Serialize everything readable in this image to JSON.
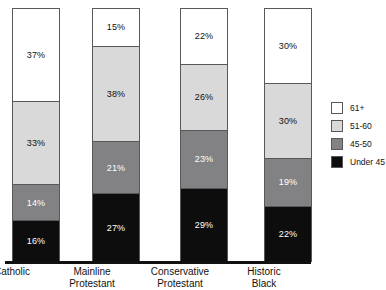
{
  "chart_data": {
    "type": "bar",
    "subtype": "stacked-100-percent",
    "title": "",
    "subtitle": "",
    "xlabel": "",
    "ylabel": "",
    "ylim": [
      0,
      100
    ],
    "grid": false,
    "legend_position": "right",
    "categories": [
      "Catholic",
      "Mainline Protestant",
      "Conservative Protestant",
      "Historic Black"
    ],
    "category_lines": [
      [
        "Catholic"
      ],
      [
        "Mainline",
        "Protestant"
      ],
      [
        "Conservative",
        "Protestant"
      ],
      [
        "Historic",
        "Black"
      ]
    ],
    "series": [
      {
        "name": "61+",
        "color": "#ffffff",
        "label_color": "#101010",
        "values": [
          37,
          15,
          22,
          30
        ]
      },
      {
        "name": "51-60",
        "color": "#d9d9d9",
        "label_color": "#101010",
        "values": [
          33,
          38,
          26,
          30
        ]
      },
      {
        "name": "45-50",
        "color": "#828285",
        "label_color": "#ffffff",
        "values": [
          14,
          21,
          23,
          19
        ]
      },
      {
        "name": "Under 45",
        "color": "#0d0d0d",
        "label_color": "#ffffff",
        "values": [
          16,
          27,
          29,
          22
        ]
      }
    ],
    "data_labels": [
      [
        "37%",
        "33%",
        "14%",
        "16%"
      ],
      [
        "15%",
        "38%",
        "21%",
        "27%"
      ],
      [
        "22%",
        "26%",
        "23%",
        "29%"
      ],
      [
        "30%",
        "30%",
        "19%",
        "22%"
      ]
    ]
  },
  "bars": [
    {
      "name": "Catholic",
      "left": 12,
      "label_left": -43,
      "segments": [
        {
          "key": "61+",
          "label": "37%",
          "pct": 37,
          "style": "seg-61"
        },
        {
          "key": "51-60",
          "label": "33%",
          "pct": 33,
          "style": "seg-5160"
        },
        {
          "key": "45-50",
          "label": "14%",
          "pct": 14,
          "style": "seg-4550"
        },
        {
          "key": "Under 45",
          "label": "16%",
          "pct": 16,
          "style": "seg-under"
        }
      ]
    },
    {
      "name": "Mainline Protestant",
      "left": 92,
      "label_left": 37,
      "segments": [
        {
          "key": "61+",
          "label": "15%",
          "pct": 15,
          "style": "seg-61"
        },
        {
          "key": "51-60",
          "label": "38%",
          "pct": 38,
          "style": "seg-5160"
        },
        {
          "key": "45-50",
          "label": "21%",
          "pct": 21,
          "style": "seg-4550"
        },
        {
          "key": "Under 45",
          "label": "27%",
          "pct": 27,
          "style": "seg-under"
        }
      ]
    },
    {
      "name": "Conservative Protestant",
      "left": 180,
      "label_left": 125,
      "segments": [
        {
          "key": "61+",
          "label": "22%",
          "pct": 22,
          "style": "seg-61"
        },
        {
          "key": "51-60",
          "label": "26%",
          "pct": 26,
          "style": "seg-5160"
        },
        {
          "key": "45-50",
          "label": "23%",
          "pct": 23,
          "style": "seg-4550"
        },
        {
          "key": "Under 45",
          "label": "29%",
          "pct": 29,
          "style": "seg-under"
        }
      ]
    },
    {
      "name": "Historic Black",
      "left": 264,
      "label_left": 209,
      "segments": [
        {
          "key": "61+",
          "label": "30%",
          "pct": 30,
          "style": "seg-61"
        },
        {
          "key": "51-60",
          "label": "30%",
          "pct": 30,
          "style": "seg-5160"
        },
        {
          "key": "45-50",
          "label": "19%",
          "pct": 19,
          "style": "seg-4550"
        },
        {
          "key": "Under 45",
          "label": "22%",
          "pct": 22,
          "style": "seg-under"
        }
      ]
    }
  ],
  "legend": {
    "items": [
      {
        "label": "61+",
        "color": "#ffffff"
      },
      {
        "label": "51-60",
        "color": "#d9d9d9"
      },
      {
        "label": "45-50",
        "color": "#828285"
      },
      {
        "label": "Under 45",
        "color": "#0d0d0d"
      }
    ]
  },
  "colors": {
    "axis": "#111111",
    "bar_outline": "#58585a",
    "text": "#111111",
    "background": "#ffffff"
  }
}
